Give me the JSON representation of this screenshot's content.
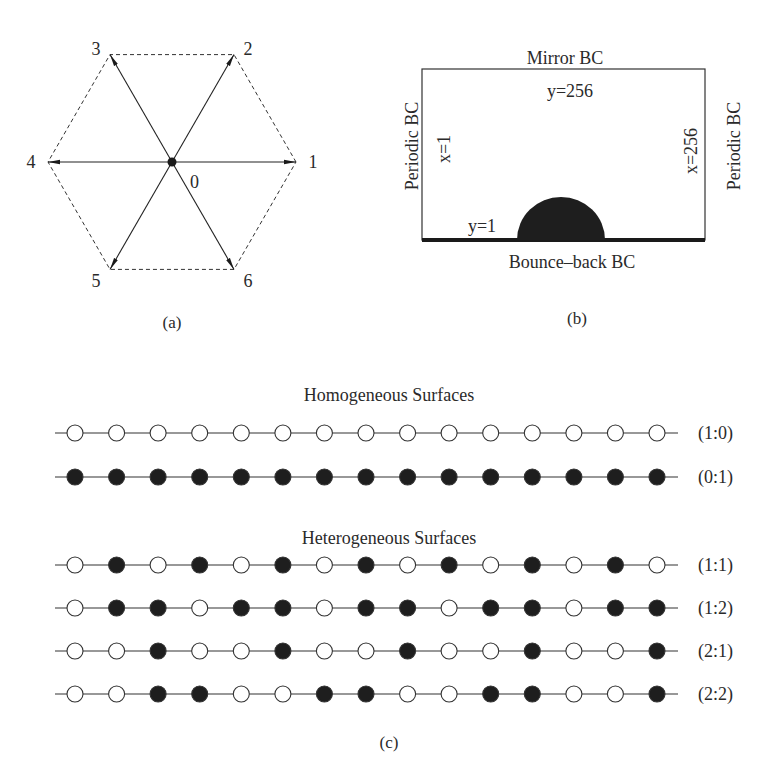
{
  "panel_a": {
    "caption": "(a)",
    "center_label": "0",
    "directions": [
      {
        "id": "1",
        "angle_deg": 0
      },
      {
        "id": "2",
        "angle_deg": 60
      },
      {
        "id": "3",
        "angle_deg": 120
      },
      {
        "id": "4",
        "angle_deg": 180
      },
      {
        "id": "5",
        "angle_deg": 240
      },
      {
        "id": "6",
        "angle_deg": 300
      }
    ]
  },
  "panel_b": {
    "caption": "(b)",
    "top_bc": "Mirror BC",
    "bottom_bc": "Bounce–back BC",
    "left_bc": "Periodic BC",
    "right_bc": "Periodic BC",
    "top_coord": "y=256",
    "bottom_coord": "y=1",
    "left_coord": "x=1",
    "right_coord": "x=256"
  },
  "panel_c": {
    "caption": "(c)",
    "groups": [
      {
        "title": "Homogeneous Surfaces",
        "rows": [
          {
            "label": "(1:0)",
            "pattern": [
              0,
              0,
              0,
              0,
              0,
              0,
              0,
              0,
              0,
              0,
              0,
              0,
              0,
              0,
              0
            ]
          },
          {
            "label": "(0:1)",
            "pattern": [
              1,
              1,
              1,
              1,
              1,
              1,
              1,
              1,
              1,
              1,
              1,
              1,
              1,
              1,
              1
            ]
          }
        ]
      },
      {
        "title": "Heterogeneous Surfaces",
        "rows": [
          {
            "label": "(1:1)",
            "pattern": [
              0,
              1,
              0,
              1,
              0,
              1,
              0,
              1,
              0,
              1,
              0,
              1,
              0,
              1,
              0
            ]
          },
          {
            "label": "(1:2)",
            "pattern": [
              0,
              1,
              1,
              0,
              1,
              1,
              0,
              1,
              1,
              0,
              1,
              1,
              0,
              1,
              1
            ]
          },
          {
            "label": "(2:1)",
            "pattern": [
              0,
              0,
              1,
              0,
              0,
              1,
              0,
              0,
              1,
              0,
              0,
              1,
              0,
              0,
              1
            ]
          },
          {
            "label": "(2:2)",
            "pattern": [
              0,
              0,
              1,
              1,
              0,
              0,
              1,
              1,
              0,
              0,
              1,
              1,
              0,
              0,
              1
            ]
          }
        ]
      }
    ],
    "legend": {
      "0": "open-site",
      "1": "filled-site"
    }
  }
}
